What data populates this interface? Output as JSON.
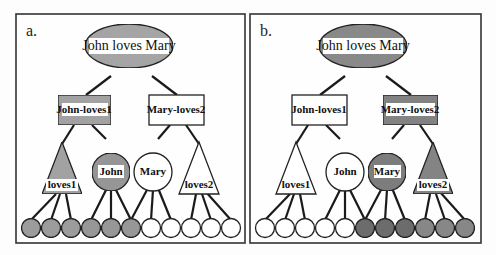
{
  "figure": {
    "panels": [
      {
        "id": "a",
        "letter": "a.",
        "root": {
          "label": "John loves Mary",
          "shape": "ellipse",
          "filled": true
        },
        "mid": [
          {
            "label": "John-loves1",
            "shape": "rect",
            "filled": true
          },
          {
            "label": "Mary-loves2",
            "shape": "rect",
            "filled": false
          }
        ],
        "low": [
          {
            "label": "loves1",
            "shape": "triangle",
            "filled": true
          },
          {
            "label": "John",
            "shape": "circle",
            "filled": true
          },
          {
            "label": "Mary",
            "shape": "circle",
            "filled": false
          },
          {
            "label": "loves2",
            "shape": "triangle",
            "filled": false
          }
        ],
        "leaves_filled": [
          true,
          true,
          true,
          true,
          true,
          true,
          false,
          false,
          false,
          false,
          false
        ]
      },
      {
        "id": "b",
        "letter": "b.",
        "root": {
          "label": "John loves Mary",
          "shape": "ellipse",
          "filled": true
        },
        "mid": [
          {
            "label": "John-loves1",
            "shape": "rect",
            "filled": false
          },
          {
            "label": "Mary-loves2",
            "shape": "rect",
            "filled": true
          }
        ],
        "low": [
          {
            "label": "loves1",
            "shape": "triangle",
            "filled": false
          },
          {
            "label": "John",
            "shape": "circle",
            "filled": false
          },
          {
            "label": "Mary",
            "shape": "circle",
            "filled": true
          },
          {
            "label": "loves2",
            "shape": "triangle",
            "filled": true
          }
        ],
        "leaves_filled": [
          false,
          false,
          false,
          false,
          false,
          true,
          true,
          true,
          true,
          true,
          true
        ]
      }
    ],
    "colors": {
      "fill_a": "#a9a9a9",
      "fill_b": "#8a8a8a",
      "empty": "#ffffff",
      "stroke": "#222222"
    }
  }
}
